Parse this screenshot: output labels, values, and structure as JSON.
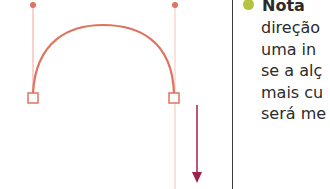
{
  "colors": {
    "curve": "#e0735f",
    "handle_line": "#f0a596",
    "guide_line": "#f3c5ba",
    "arrow": "#a0204a",
    "bullet": "#b6c43d",
    "divider": "#3a3a3a",
    "text": "#2b2b2b"
  },
  "note": {
    "title": "Nota",
    "lines": [
      "direção",
      "uma in",
      "se a alç",
      "mais cu",
      "será me"
    ]
  },
  "diagram": {
    "left_anchor": {
      "x": 33,
      "y": 98
    },
    "right_anchor": {
      "x": 174,
      "y": 98
    },
    "left_handle": {
      "x": 33,
      "y": 5
    },
    "right_handle": {
      "x": 175,
      "y": 5
    },
    "arrow": {
      "x": 197,
      "y_start": 105,
      "y_end": 182,
      "direction": "down"
    }
  }
}
